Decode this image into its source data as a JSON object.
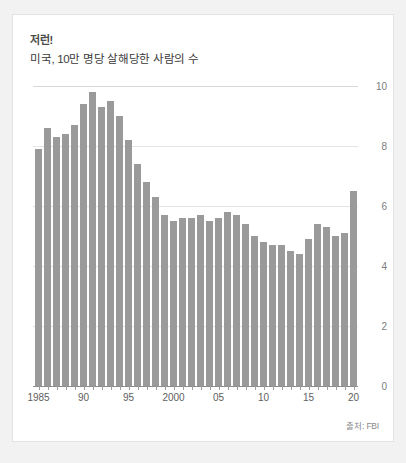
{
  "card": {
    "title": "저런!",
    "subtitle": "미국, 10만 명당 살해당한 사람의 수",
    "source": "출처: FBI"
  },
  "chart_data": {
    "type": "bar",
    "title": "저런!",
    "subtitle": "미국, 10만 명당 살해당한 사람의 수",
    "xlabel": "",
    "ylabel": "",
    "ylim": [
      0,
      10
    ],
    "yticks": [
      0,
      2,
      4,
      6,
      8,
      10
    ],
    "ytick_labels": [
      "0",
      "2",
      "4",
      "6",
      "8",
      "10"
    ],
    "xtick_years": [
      1985,
      1990,
      1995,
      2000,
      2005,
      2010,
      2015,
      2020
    ],
    "xtick_labels": [
      "1985",
      "90",
      "95",
      "2000",
      "05",
      "10",
      "15",
      "20"
    ],
    "grid": true,
    "legend": false,
    "bar_color": "#9a9a9a",
    "source": "출처: FBI",
    "categories": [
      1985,
      1986,
      1987,
      1988,
      1989,
      1990,
      1991,
      1992,
      1993,
      1994,
      1995,
      1996,
      1997,
      1998,
      1999,
      2000,
      2001,
      2002,
      2003,
      2004,
      2005,
      2006,
      2007,
      2008,
      2009,
      2010,
      2011,
      2012,
      2013,
      2014,
      2015,
      2016,
      2017,
      2018,
      2019,
      2020
    ],
    "values": [
      7.9,
      8.6,
      8.3,
      8.4,
      8.7,
      9.4,
      9.8,
      9.3,
      9.5,
      9.0,
      8.2,
      7.4,
      6.8,
      6.3,
      5.7,
      5.5,
      5.6,
      5.6,
      5.7,
      5.5,
      5.6,
      5.8,
      5.7,
      5.4,
      5.0,
      4.8,
      4.7,
      4.7,
      4.5,
      4.4,
      4.9,
      5.4,
      5.3,
      5.0,
      5.1,
      6.5
    ]
  }
}
